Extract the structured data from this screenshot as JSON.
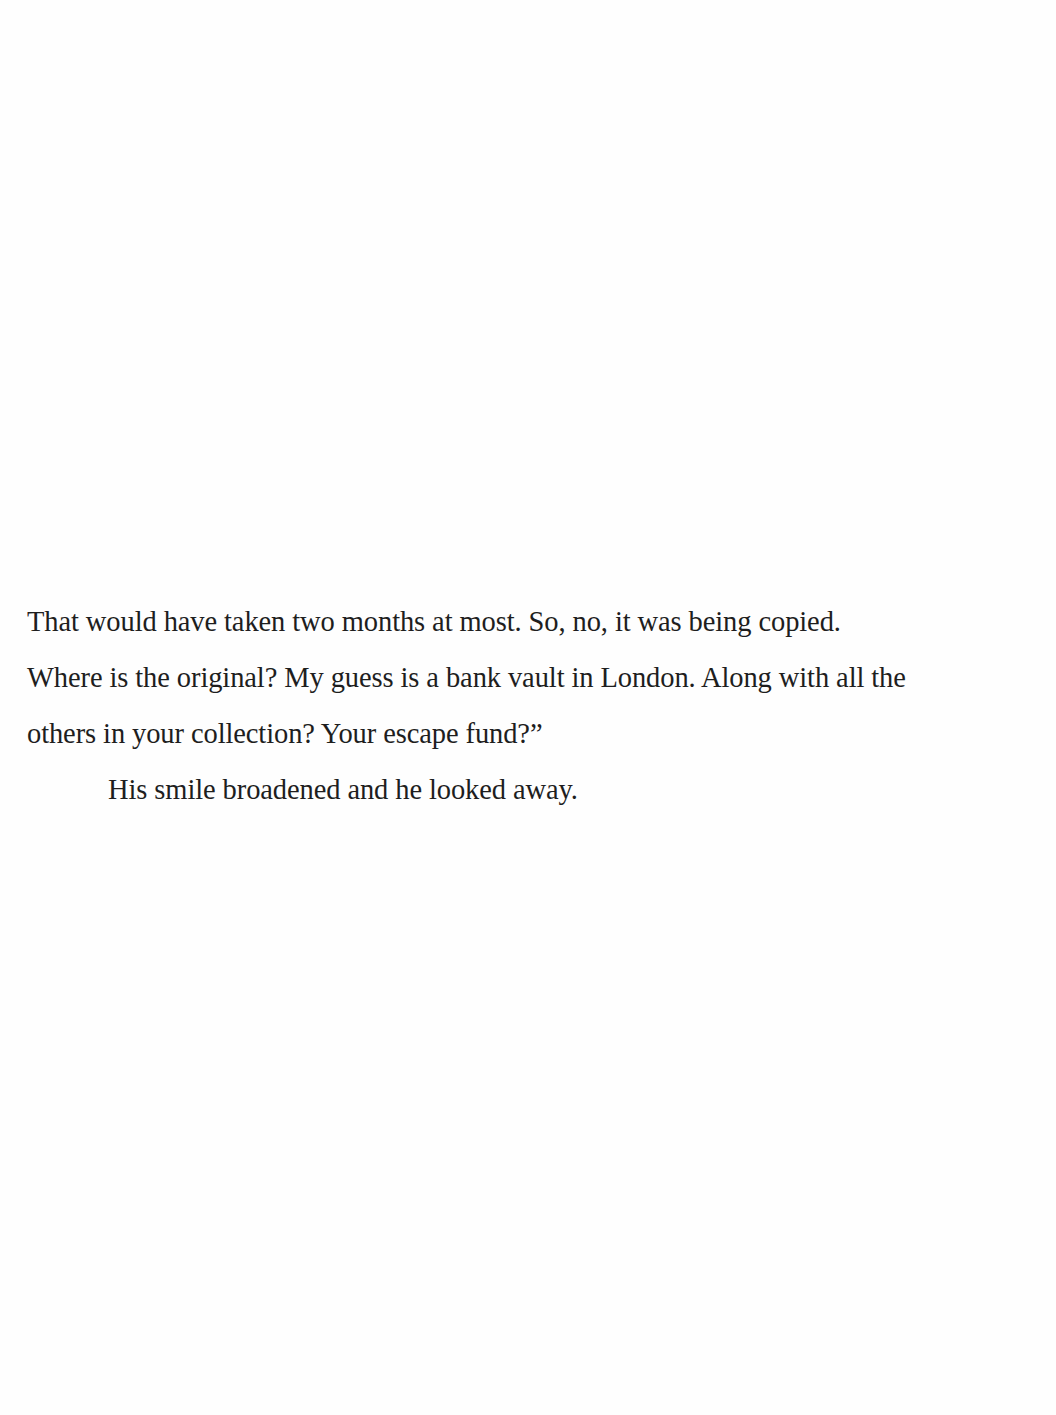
{
  "document": {
    "lines": [
      "That would have taken two months at most. So, no, it was being copied.",
      "Where is the original? My guess is a bank vault in London. Along with all the",
      "others in your collection? Your escape fund?”",
      "His smile broadened and he looked away."
    ]
  }
}
